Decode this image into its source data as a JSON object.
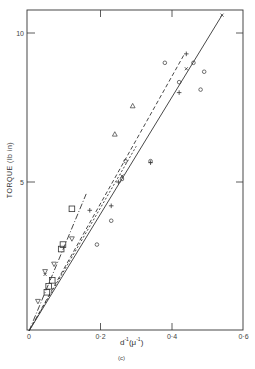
{
  "chart_data": {
    "type": "scatter",
    "title": "",
    "caption": "(c)",
    "xlabel": "d⁻¹(μ⁻¹)",
    "xlabel_base": "d",
    "xlabel_exp": "-1",
    "xlabel_unit": "(μ",
    "xlabel_unit_exp": "-1",
    "xlabel_unit_close": ")",
    "ylabel": "TORQUE   (lb in)",
    "xlim": [
      0,
      0.6
    ],
    "ylim": [
      0,
      11
    ],
    "x_ticks": [
      0,
      0.2,
      0.4,
      0.6
    ],
    "x_tick_labels": [
      "0",
      "0·2",
      "0·4",
      "0·6"
    ],
    "y_ticks": [
      5,
      10
    ],
    "y_tick_labels": [
      "5",
      "10"
    ],
    "grid": false,
    "legend": null,
    "fit_lines": [
      {
        "style": "solid",
        "from": [
          0,
          0
        ],
        "to": [
          0.54,
          10.6
        ]
      },
      {
        "style": "dashed",
        "from": [
          0,
          0
        ],
        "to": [
          0.435,
          9.3
        ]
      },
      {
        "style": "short-dashed",
        "from": [
          0,
          0
        ],
        "to": [
          0.3,
          6.2
        ]
      },
      {
        "style": "dash-dot",
        "from": [
          0,
          0
        ],
        "to": [
          0.16,
          4.6
        ]
      }
    ],
    "series": [
      {
        "name": "circle",
        "marker": "o",
        "points": [
          [
            0.38,
            9.0
          ],
          [
            0.46,
            9.0
          ],
          [
            0.49,
            8.7
          ],
          [
            0.42,
            8.35
          ],
          [
            0.48,
            8.1
          ],
          [
            0.27,
            5.7
          ],
          [
            0.34,
            5.7
          ],
          [
            0.23,
            3.7
          ],
          [
            0.19,
            2.9
          ],
          [
            0.26,
            5.1
          ]
        ]
      },
      {
        "name": "plus",
        "marker": "+",
        "points": [
          [
            0.44,
            9.3
          ],
          [
            0.42,
            8.0
          ],
          [
            0.34,
            5.65
          ],
          [
            0.23,
            4.2
          ],
          [
            0.17,
            4.05
          ],
          [
            0.25,
            5.0
          ]
        ]
      },
      {
        "name": "cross",
        "marker": "x",
        "points": [
          [
            0.54,
            10.6
          ],
          [
            0.44,
            8.8
          ],
          [
            0.26,
            5.2
          ],
          [
            0.045,
            1.9
          ]
        ]
      },
      {
        "name": "triangle",
        "marker": "^",
        "points": [
          [
            0.29,
            7.55
          ],
          [
            0.24,
            6.6
          ]
        ]
      },
      {
        "name": "inverted-triangle",
        "marker": "v",
        "points": [
          [
            0.12,
            3.1
          ],
          [
            0.07,
            2.25
          ],
          [
            0.045,
            2.0
          ],
          [
            0.025,
            1.0
          ]
        ]
      },
      {
        "name": "square",
        "marker": "s",
        "points": [
          [
            0.12,
            4.1
          ],
          [
            0.095,
            2.9
          ],
          [
            0.09,
            2.75
          ],
          [
            0.065,
            1.7
          ],
          [
            0.055,
            1.5
          ],
          [
            0.05,
            1.3
          ]
        ]
      }
    ]
  }
}
